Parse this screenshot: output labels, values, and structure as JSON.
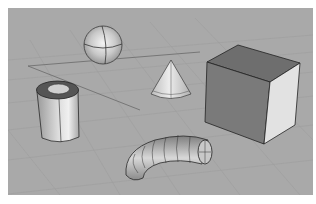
{
  "viewport": {
    "name": "Perspective viewport",
    "background": "#a9a9a9",
    "grid_color": "#9a9a9a",
    "axis_line_color": "#6a6a6a",
    "objects": [
      {
        "id": "sphere",
        "type": "sphere"
      },
      {
        "id": "cone",
        "type": "cone"
      },
      {
        "id": "box",
        "type": "box"
      },
      {
        "id": "tube",
        "type": "tube"
      },
      {
        "id": "pipe",
        "type": "pipe"
      }
    ]
  }
}
